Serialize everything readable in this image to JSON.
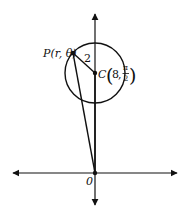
{
  "diagram": {
    "type": "polar-circle-geometry",
    "point_p": {
      "name": "P",
      "coords": "(r, θ)",
      "label": "P(r, θ)"
    },
    "center_c": {
      "name": "C",
      "r": "8",
      "theta_num": "π",
      "theta_den": "2"
    },
    "origin": {
      "label": "0"
    },
    "radius_label": "2",
    "colors": {
      "ink": "#111111",
      "background": "#ffffff"
    }
  }
}
